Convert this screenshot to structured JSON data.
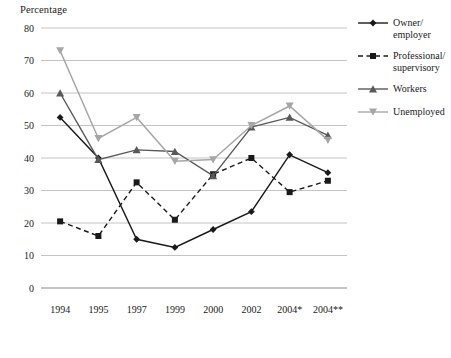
{
  "chart_data": {
    "type": "line",
    "title": "",
    "ylabel": "Percentage",
    "xlabel": "",
    "ylim": [
      0,
      80
    ],
    "ytick_step": 10,
    "grid": true,
    "legend_position": "right",
    "categories": [
      "1994",
      "1995",
      "1997",
      "1999",
      "2000",
      "2002",
      "2004*",
      "2004**"
    ],
    "yticks": [
      "0",
      "10",
      "20",
      "30",
      "40",
      "50",
      "60",
      "70",
      "80"
    ],
    "series": [
      {
        "name": "Owner/\nemployer",
        "legend_label": "Owner/\nemployer",
        "color": "#1a1a1a",
        "dash": "solid",
        "marker": "diamond",
        "values": [
          52.5,
          40,
          15,
          12.5,
          18,
          23.5,
          41,
          35.5
        ]
      },
      {
        "name": "Professional/\nsupervisory",
        "legend_label": "Professional/\nsupervisory",
        "color": "#1a1a1a",
        "dash": "dashed",
        "marker": "square",
        "values": [
          20.5,
          16,
          32.5,
          21,
          35,
          40,
          29.5,
          33
        ]
      },
      {
        "name": "Workers",
        "legend_label": "Workers",
        "color": "#595959",
        "dash": "solid",
        "marker": "triangle-up",
        "values": [
          60,
          39.5,
          42.5,
          42,
          34.5,
          49.5,
          52.5,
          47
        ]
      },
      {
        "name": "Unemployed",
        "legend_label": "Unemployed",
        "color": "#a6a6a6",
        "dash": "solid",
        "marker": "triangle-down",
        "values": [
          73,
          46,
          52.5,
          39,
          39.5,
          50,
          56,
          45.5
        ]
      }
    ]
  },
  "legend": {
    "items": [
      {
        "label": "Owner/\nemployer",
        "marker": "diamond",
        "dash": "solid",
        "color": "#1a1a1a"
      },
      {
        "label": "Professional/\nsupervisory",
        "marker": "square",
        "dash": "dashed",
        "color": "#1a1a1a"
      },
      {
        "label": "Workers",
        "marker": "triangle-up",
        "dash": "solid",
        "color": "#595959"
      },
      {
        "label": "Unemployed",
        "marker": "triangle-down",
        "dash": "solid",
        "color": "#a6a6a6"
      }
    ]
  }
}
